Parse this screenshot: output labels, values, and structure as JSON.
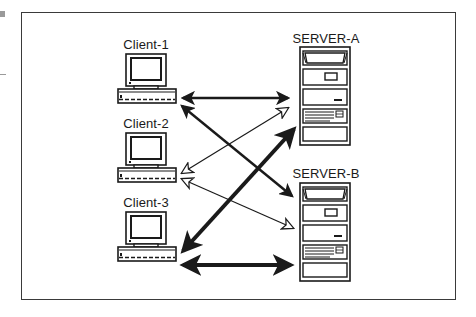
{
  "diagram": {
    "title": "",
    "clients": [
      {
        "id": "client-1",
        "label": "Client-1"
      },
      {
        "id": "client-2",
        "label": "Client-2"
      },
      {
        "id": "client-3",
        "label": "Client-3"
      }
    ],
    "servers": [
      {
        "id": "server-a",
        "label": "SERVER-A"
      },
      {
        "id": "server-b",
        "label": "SERVER-B"
      }
    ],
    "connections": [
      {
        "from": "client-1",
        "to": "server-a",
        "style": "medium",
        "heads": "solid-both"
      },
      {
        "from": "client-1",
        "to": "server-b",
        "style": "medium",
        "heads": "solid-both"
      },
      {
        "from": "client-2",
        "to": "server-a",
        "style": "thin",
        "heads": "hollow-both"
      },
      {
        "from": "client-2",
        "to": "server-b",
        "style": "thin",
        "heads": "hollow-both"
      },
      {
        "from": "client-3",
        "to": "server-a",
        "style": "thick",
        "heads": "solid-both"
      },
      {
        "from": "client-3",
        "to": "server-b",
        "style": "thick",
        "heads": "solid-both"
      }
    ]
  },
  "colors": {
    "ink": "#1a1a1a",
    "frame": "#3a3a3a",
    "background": "#ffffff"
  }
}
